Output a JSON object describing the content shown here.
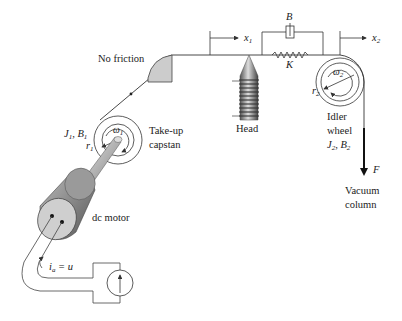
{
  "diagram": {
    "labels": {
      "no_friction": "No friction",
      "x1": "x",
      "x1_sub": "1",
      "x2": "x",
      "x2_sub": "2",
      "damper": "B",
      "spring": "K",
      "head": "Head",
      "omega1": "ω",
      "omega1_sub": "1",
      "r1": "r",
      "r1_sub": "1",
      "J1B1": "J",
      "J1B1_sub1": "1",
      "J1B1_mid": ", B",
      "J1B1_sub2": "1",
      "takeup_line1": "Take-up",
      "takeup_line2": "capstan",
      "omega2": "ω",
      "omega2_sub": "2",
      "r2": "r",
      "r2_sub": "2",
      "idler_line1": "Idler",
      "idler_line2": "wheel",
      "J2": "J",
      "J2_sub1": "2",
      "J2_mid": ", B",
      "J2_sub2": "2",
      "force": "F",
      "vacuum_line1": "Vacuum",
      "vacuum_line2": "column",
      "motor": "dc motor",
      "current": "i",
      "current_sub": "a",
      "current_eq": " = u"
    },
    "colors": {
      "line": "#333333",
      "block_fill": "#cccccc",
      "motor_body": "#9a9a9a",
      "motor_face": "#cfcfcf"
    }
  }
}
